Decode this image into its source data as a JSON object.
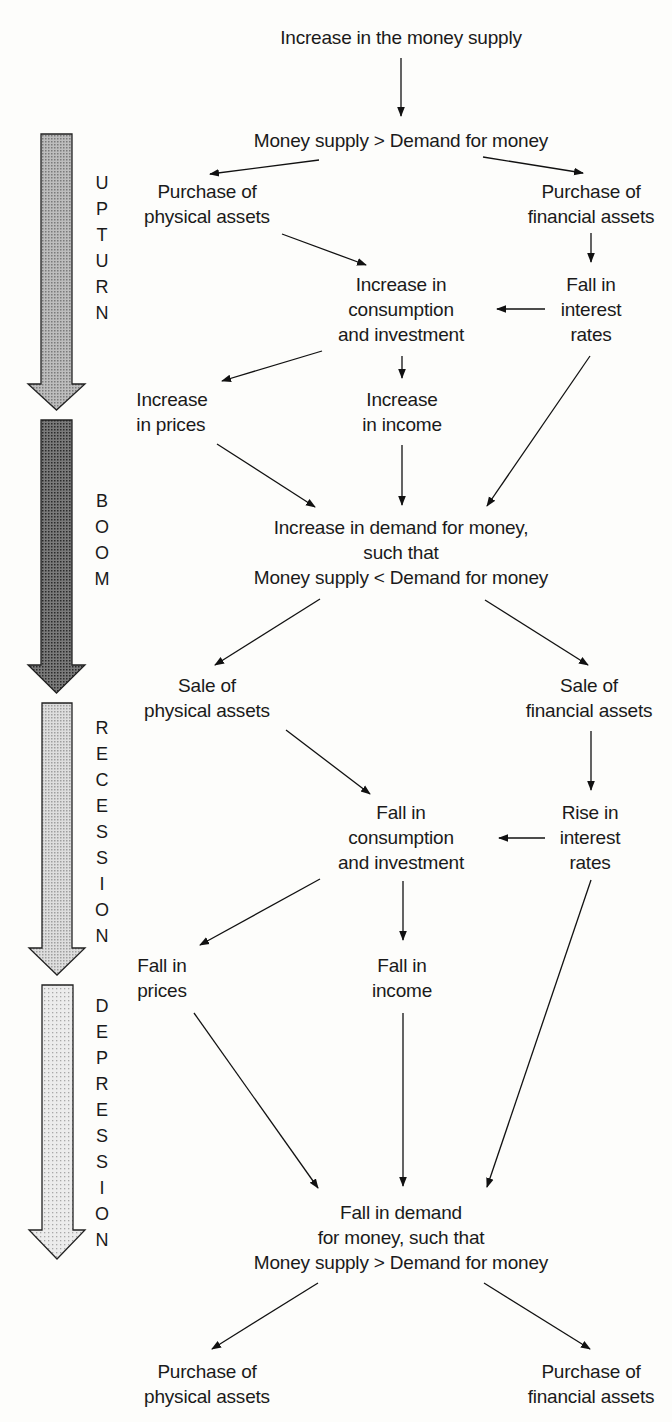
{
  "diagram": {
    "type": "flowchart",
    "nodes": {
      "start": [
        "Increase in the money supply"
      ],
      "excess_supply_1": [
        "Money supply > Demand for money"
      ],
      "purchase_physical_1": [
        "Purchase of",
        "physical assets"
      ],
      "purchase_financial_1": [
        "Purchase of",
        "financial assets"
      ],
      "increase_consumption": [
        "Increase in",
        "consumption",
        "and investment"
      ],
      "fall_interest": [
        "Fall in",
        "interest",
        "rates"
      ],
      "increase_prices": [
        "Increase",
        "in prices"
      ],
      "increase_income": [
        "Increase",
        "in income"
      ],
      "increase_demand_money": [
        "Increase in demand for money,",
        "such that",
        "Money supply < Demand for money"
      ],
      "sale_physical": [
        "Sale of",
        "physical assets"
      ],
      "sale_financial": [
        "Sale of",
        "financial assets"
      ],
      "fall_consumption": [
        "Fall in",
        "consumption",
        "and investment"
      ],
      "rise_interest": [
        "Rise in",
        "interest",
        "rates"
      ],
      "fall_prices": [
        "Fall in",
        "prices"
      ],
      "fall_income": [
        "Fall in",
        "income"
      ],
      "fall_demand_money": [
        "Fall in demand",
        "for money, such that",
        "Money supply > Demand for money"
      ],
      "purchase_physical_2": [
        "Purchase of",
        "physical assets"
      ],
      "purchase_financial_2": [
        "Purchase of",
        "financial assets"
      ]
    },
    "phases": [
      {
        "label": "UPTURN",
        "letters": [
          "U",
          "P",
          "T",
          "U",
          "R",
          "N"
        ],
        "shade": "#9c9c9c"
      },
      {
        "label": "BOOM",
        "letters": [
          "B",
          "O",
          "O",
          "M"
        ],
        "shade": "#555555"
      },
      {
        "label": "RECESSION",
        "letters": [
          "R",
          "E",
          "C",
          "E",
          "S",
          "S",
          "I",
          "O",
          "N"
        ],
        "shade": "#c4c4c4"
      },
      {
        "label": "DEPRESSION",
        "letters": [
          "D",
          "E",
          "P",
          "R",
          "E",
          "S",
          "S",
          "I",
          "O",
          "N"
        ],
        "shade": "#dadada"
      }
    ],
    "edges": [
      [
        "start",
        "excess_supply_1"
      ],
      [
        "excess_supply_1",
        "purchase_physical_1"
      ],
      [
        "excess_supply_1",
        "purchase_financial_1"
      ],
      [
        "purchase_physical_1",
        "increase_consumption"
      ],
      [
        "purchase_financial_1",
        "fall_interest"
      ],
      [
        "fall_interest",
        "increase_consumption"
      ],
      [
        "increase_consumption",
        "increase_prices"
      ],
      [
        "increase_consumption",
        "increase_income"
      ],
      [
        "increase_prices",
        "increase_demand_money"
      ],
      [
        "increase_income",
        "increase_demand_money"
      ],
      [
        "fall_interest",
        "increase_demand_money"
      ],
      [
        "increase_demand_money",
        "sale_physical"
      ],
      [
        "increase_demand_money",
        "sale_financial"
      ],
      [
        "sale_physical",
        "fall_consumption"
      ],
      [
        "sale_financial",
        "rise_interest"
      ],
      [
        "rise_interest",
        "fall_consumption"
      ],
      [
        "fall_consumption",
        "fall_prices"
      ],
      [
        "fall_consumption",
        "fall_income"
      ],
      [
        "fall_prices",
        "fall_demand_money"
      ],
      [
        "fall_income",
        "fall_demand_money"
      ],
      [
        "rise_interest",
        "fall_demand_money"
      ],
      [
        "fall_demand_money",
        "purchase_physical_2"
      ],
      [
        "fall_demand_money",
        "purchase_financial_2"
      ]
    ]
  }
}
